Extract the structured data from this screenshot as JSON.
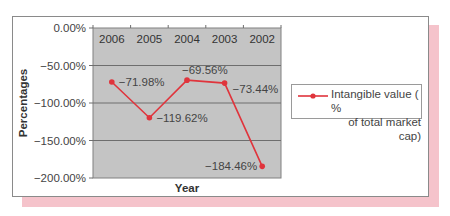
{
  "chart_data": {
    "type": "line",
    "title": "",
    "xlabel": "Year",
    "ylabel": "Percentages",
    "categories": [
      "2006",
      "2005",
      "2004",
      "2003",
      "2002"
    ],
    "series": [
      {
        "name": "Intangible value ( % of total market cap)",
        "values": [
          -71.98,
          -119.62,
          -69.56,
          -73.44,
          -184.46
        ],
        "labels": [
          "−71.98%",
          "−119.62%",
          "−69.56%",
          "−73.44%",
          "−184.46%"
        ],
        "color": "#e0343c"
      }
    ],
    "ylim": [
      -200,
      0
    ],
    "yticks": [
      "0.00%",
      "−50.00%",
      "−100.00%",
      "−150.00%",
      "−200.00%"
    ],
    "ytick_values": [
      0,
      -50,
      -100,
      -150,
      -200
    ],
    "grid": true,
    "x_axis_position": "top",
    "legend_position": "right",
    "plot_background": "#c4c4c4",
    "shadow_color": "#f5c3cb"
  },
  "legend": {
    "line1": "Intangible value ( %",
    "line2": "of total market cap)"
  }
}
